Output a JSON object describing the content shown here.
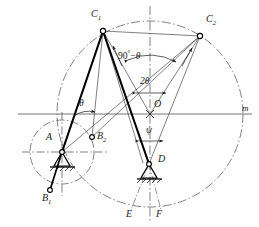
{
  "figure": {
    "type": "kinematic-linkage-diagram",
    "stroke_color": "#1a1a1a",
    "thick_link_color": "#000000",
    "background": "#ffffff"
  },
  "points": {
    "C1": {
      "label": "C",
      "sub": "1",
      "x": 103,
      "y": 31,
      "label_x": 91,
      "label_y": 14
    },
    "C2": {
      "label": "C",
      "sub": "2",
      "x": 200,
      "y": 36,
      "label_x": 206,
      "label_y": 19
    },
    "O": {
      "label": "O",
      "sub": "",
      "x": 150,
      "y": 114,
      "label_x": 155,
      "label_y": 104
    },
    "A": {
      "label": "A",
      "sub": "",
      "x": 62,
      "y": 152,
      "label_x": 47,
      "label_y": 138
    },
    "B1": {
      "label": "B",
      "sub": "1",
      "x": 50,
      "y": 190,
      "label_x": 43,
      "label_y": 194
    },
    "B2": {
      "label": "B",
      "sub": "2",
      "x": 92,
      "y": 137,
      "label_x": 96,
      "label_y": 132
    },
    "D": {
      "label": "D",
      "sub": "",
      "x": 149,
      "y": 164,
      "label_x": 157,
      "label_y": 157
    },
    "E": {
      "label": "E",
      "sub": "",
      "x": 131,
      "y": 208,
      "label_x": 127,
      "label_y": 210
    },
    "F": {
      "label": "F",
      "sub": "",
      "x": 160,
      "y": 208,
      "label_x": 157,
      "label_y": 210
    }
  },
  "angles": {
    "theta": {
      "text": "θ",
      "x": 82,
      "y": 105
    },
    "two_theta": {
      "text": "2θ",
      "x": 142,
      "y": 82
    },
    "psi": {
      "text": "ψ",
      "x": 148,
      "y": 130
    },
    "ninety_minus_theta": {
      "prefix": "90",
      "degree": "°",
      "minus": "−",
      "symbol": "θ",
      "x": 124,
      "y": 55
    }
  },
  "axis": {
    "m_label": {
      "text": "m",
      "x": 243,
      "y": 108
    }
  },
  "geometry": {
    "big_circle": {
      "cx": 150,
      "cy": 114,
      "r": 93
    },
    "small_circle": {
      "cx": 62,
      "cy": 152,
      "r": 32
    },
    "arc_c1_c2": {
      "note": "arc spanning C1 to C2 with arrowheads at both ends"
    },
    "bottom_arc": {
      "note": "arc through E and F along big circle"
    }
  }
}
